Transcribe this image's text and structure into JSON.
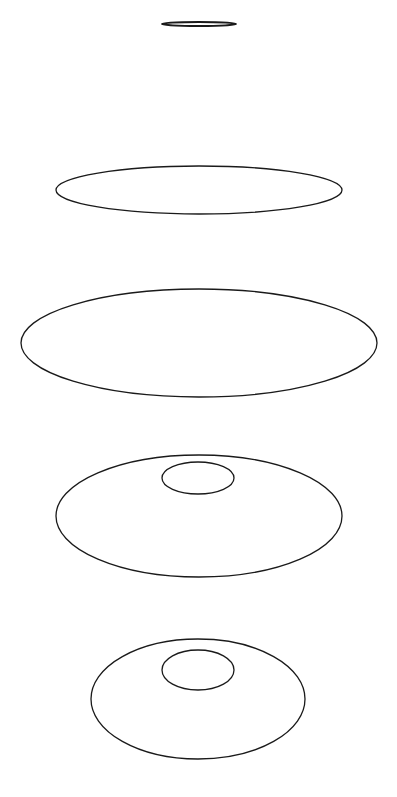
{
  "diagram": {
    "width": 397,
    "height": 797,
    "stroke_color": "#1a1a1a",
    "background": "#ffffff",
    "figures": [
      {
        "name": "figure-1-flat-ellipse",
        "shapes": [
          {
            "cx": 199,
            "cy": 24,
            "rx": 37,
            "ry": 2,
            "stroke_width": 2
          }
        ]
      },
      {
        "name": "figure-2-wide-ellipse",
        "shapes": [
          {
            "cx": 199,
            "cy": 190,
            "rx": 143,
            "ry": 24,
            "stroke_width": 1.3
          }
        ]
      },
      {
        "name": "figure-3-large-ellipse",
        "shapes": [
          {
            "cx": 199,
            "cy": 343,
            "rx": 178,
            "ry": 54,
            "stroke_width": 1.3
          }
        ]
      },
      {
        "name": "figure-4-ellipse-with-inner",
        "shapes": [
          {
            "cx": 199,
            "cy": 516,
            "rx": 143,
            "ry": 61,
            "stroke_width": 1.3
          },
          {
            "cx": 198,
            "cy": 478,
            "rx": 36,
            "ry": 16,
            "stroke_width": 1.3
          }
        ]
      },
      {
        "name": "figure-5-ellipse-with-inner",
        "shapes": [
          {
            "cx": 198,
            "cy": 699,
            "rx": 107,
            "ry": 60,
            "stroke_width": 1.3
          },
          {
            "cx": 198,
            "cy": 670,
            "rx": 36,
            "ry": 20,
            "stroke_width": 1.3
          }
        ]
      }
    ]
  }
}
